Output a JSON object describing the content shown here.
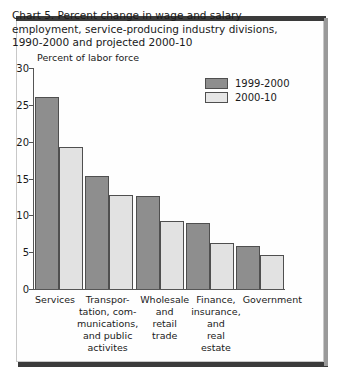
{
  "chart_data": {
    "type": "bar",
    "title": "Chart 5. Percent change in wage and salary employment, service-producing industry divisions, 1990-2000 and projected 2000-10",
    "ylabel": "Percent of labor force",
    "xlabel": "",
    "ylim": [
      0,
      30
    ],
    "yticks": [
      30,
      25,
      20,
      15,
      10,
      5,
      0
    ],
    "grid": false,
    "legend_position": "top-right",
    "categories": [
      "Services",
      "Transpor-\ntation, com-\nmunications,\nand public\nactivites",
      "Wholesale\nand\nretail\ntrade",
      "Finance,\ninsurance,\nand\nreal estate",
      "Government"
    ],
    "series": [
      {
        "name": "1999-2000",
        "color": "#8e8e8e",
        "values": [
          26.0,
          15.3,
          12.6,
          8.9,
          5.9
        ]
      },
      {
        "name": "2000-10",
        "color": "#e2e2e2",
        "values": [
          19.3,
          12.8,
          9.2,
          6.2,
          4.6
        ]
      }
    ]
  }
}
